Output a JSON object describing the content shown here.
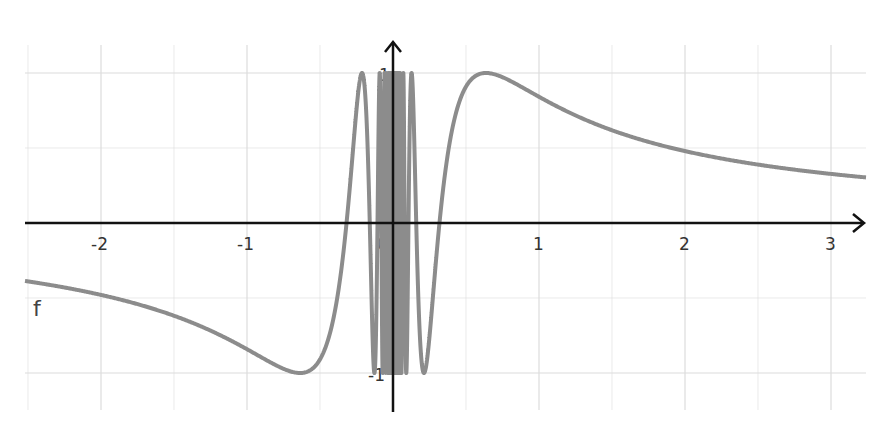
{
  "chart_data": {
    "type": "line",
    "title": "",
    "function_label": "f",
    "function_expression": "sin(1/x)",
    "xlabel": "",
    "ylabel": "",
    "xlim": [
      -2.6,
      3.25
    ],
    "ylim": [
      -1.28,
      1.22
    ],
    "x_ticks": [
      -2,
      -1,
      0,
      1,
      2,
      3
    ],
    "x_tick_labels": [
      "-2",
      "-1",
      "0",
      "1",
      "2",
      "3"
    ],
    "y_ticks": [
      -1,
      1
    ],
    "y_tick_labels": [
      "-1",
      "1"
    ],
    "grid": true,
    "grid_minor_step": 0.5,
    "series": [
      {
        "name": "f",
        "color": "#8c8c8c",
        "points_sampled": [
          [
            -2.5,
            -0.389
          ],
          [
            -2.0,
            -0.479
          ],
          [
            -1.5,
            -0.618
          ],
          [
            -1.0,
            -0.841
          ],
          [
            -0.637,
            -1.0
          ],
          [
            -0.4,
            -0.598
          ],
          [
            -0.212,
            1.0
          ],
          [
            -0.127,
            -1.0
          ],
          [
            0.127,
            1.0
          ],
          [
            0.212,
            -1.0
          ],
          [
            0.4,
            0.598
          ],
          [
            0.637,
            1.0
          ],
          [
            1.0,
            0.841
          ],
          [
            1.5,
            0.618
          ],
          [
            2.0,
            0.479
          ],
          [
            2.5,
            0.389
          ],
          [
            3.0,
            0.327
          ],
          [
            3.25,
            0.303
          ]
        ]
      }
    ]
  },
  "colors": {
    "axis": "#111111",
    "grid": "#dcdcdc",
    "curve": "#8c8c8c"
  }
}
